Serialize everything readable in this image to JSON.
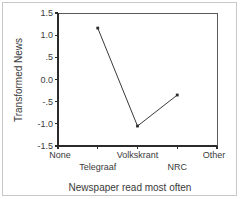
{
  "chart_data": {
    "type": "line",
    "title": "",
    "xlabel": "Newspaper read most often",
    "ylabel": "Transformed News",
    "categories": [
      "None",
      "Telegraaf",
      "Volkskrant",
      "NRC",
      "Other"
    ],
    "x_tick_labels": [
      "None",
      "Telegraaf",
      "Volkskrant",
      "NRC",
      "Other"
    ],
    "x_tick_rows": [
      {
        "label": "None",
        "row": 0
      },
      {
        "label": "Telegraaf",
        "row": 1
      },
      {
        "label": "Volkskrant",
        "row": 0
      },
      {
        "label": "NRC",
        "row": 1
      },
      {
        "label": "Other",
        "row": 0
      }
    ],
    "y_tick_labels": [
      "1.5",
      "1.0",
      ".5",
      "0.0",
      "-.5",
      "-1.0",
      "-1.5"
    ],
    "y_tick_values": [
      1.5,
      1.0,
      0.5,
      0.0,
      -0.5,
      -1.0,
      -1.5
    ],
    "ylim": [
      -1.5,
      1.5
    ],
    "grid": false,
    "legend": false,
    "legend_position": "none",
    "series": [
      {
        "name": "Transformed News",
        "marker": "square",
        "color": "#2b2b2b",
        "points": [
          {
            "category": "Telegraaf",
            "x": 1,
            "y": 1.16
          },
          {
            "category": "Volkskrant",
            "x": 2,
            "y": -1.05
          },
          {
            "category": "NRC",
            "x": 3,
            "y": -0.35
          }
        ]
      }
    ]
  },
  "figure": {
    "frame_color": "#5a5a5a",
    "border_color": "#c8c8c8",
    "background": "#ffffff"
  }
}
